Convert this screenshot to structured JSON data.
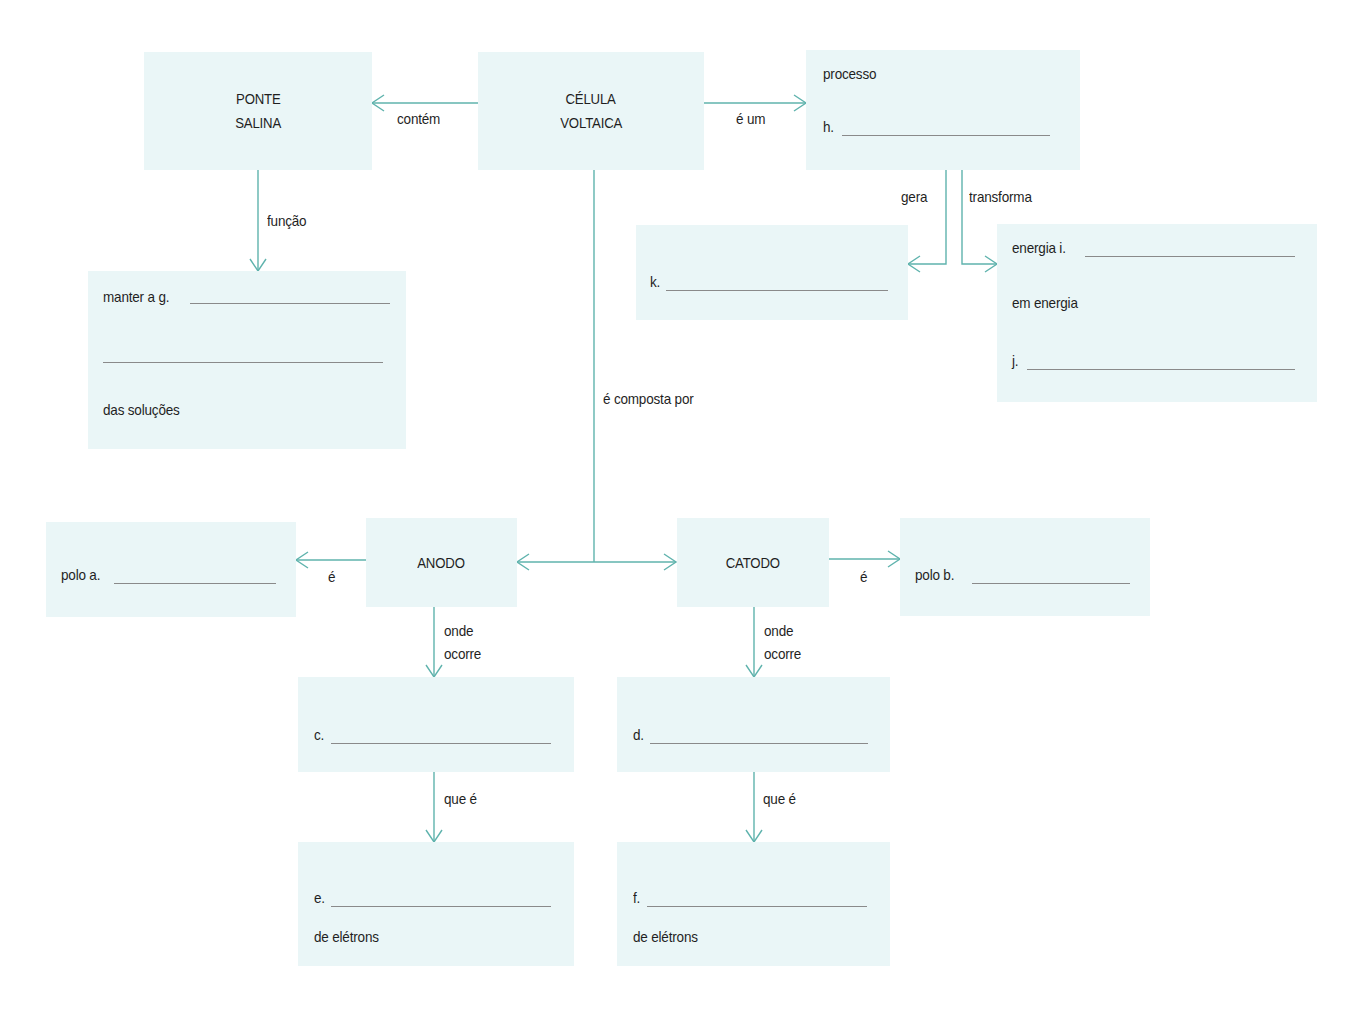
{
  "colors": {
    "box_fill": "#eaf6f7",
    "connector": "#5fb3ad",
    "text": "#1f1f1f",
    "blank_line": "#8a8a8a"
  },
  "nodes": {
    "celula": {
      "line1": "CÉLULA",
      "line2": "VOLTAICA"
    },
    "ponte": {
      "line1": "PONTE",
      "line2": "SALINA"
    },
    "processo": {
      "label": "processo",
      "blank_prefix": "h."
    },
    "funcao_box": {
      "prefix": "manter a g.",
      "suffix": "das soluções"
    },
    "k_box": {
      "blank_prefix": "k."
    },
    "energia_box": {
      "prefix": "energia i.",
      "middle": "em energia",
      "blank_prefix": "j."
    },
    "anodo": {
      "title": "ANODO"
    },
    "catodo": {
      "title": "CATODO"
    },
    "polo_a": {
      "prefix": "polo a."
    },
    "polo_b": {
      "prefix": "polo b."
    },
    "c_box": {
      "blank_prefix": "c."
    },
    "d_box": {
      "blank_prefix": "d."
    },
    "e_box": {
      "blank_prefix": "e.",
      "suffix": "de elétrons"
    },
    "f_box": {
      "blank_prefix": "f.",
      "suffix": "de elétrons"
    }
  },
  "links": {
    "contem": "contém",
    "e_um": "é um",
    "funcao": "função",
    "gera": "gera",
    "transforma": "transforma",
    "composta": "é composta por",
    "anodo_e": "é",
    "catodo_e": "é",
    "anodo_onde1": "onde",
    "anodo_onde2": "ocorre",
    "catodo_onde1": "onde",
    "catodo_onde2": "ocorre",
    "anodo_que": "que é",
    "catodo_que": "que é"
  }
}
